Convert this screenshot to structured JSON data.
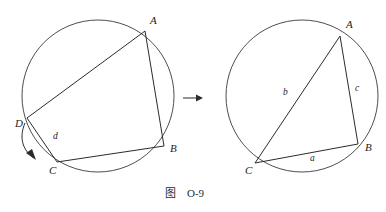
{
  "caption": {
    "prefix": "图",
    "number": "O-9"
  },
  "colors": {
    "ink": "#2b2b2b",
    "circle_stroke": "#3a3a3a",
    "background": "#ffffff"
  },
  "left_figure": {
    "name": "cyclic-quadrilateral-abcd",
    "circle": {
      "cx": 98,
      "cy": 96,
      "r": 76
    },
    "vertices": [
      {
        "id": "A",
        "label": "A",
        "x": 145,
        "y": 31,
        "label_x": 150,
        "label_y": 24
      },
      {
        "id": "B",
        "label": "B",
        "x": 164,
        "y": 146,
        "label_x": 170,
        "label_y": 152
      },
      {
        "id": "C",
        "label": "C",
        "x": 57,
        "y": 162,
        "label_x": 49,
        "label_y": 174
      },
      {
        "id": "D",
        "label": "D",
        "x": 27,
        "y": 118,
        "label_x": 15,
        "label_y": 127
      }
    ],
    "edges": [
      {
        "from": "D",
        "to": "A"
      },
      {
        "from": "A",
        "to": "B"
      },
      {
        "from": "B",
        "to": "C"
      },
      {
        "from": "C",
        "to": "D"
      }
    ],
    "side_labels": [
      {
        "text": "d",
        "x": 53,
        "y": 139
      }
    ],
    "motion_arrow": {
      "name": "d-to-c-motion-arrow",
      "from": "D",
      "to": "C",
      "path": "M 25 123 C 19 137 22 150 34 158",
      "head": "36,160 26,153 32,149"
    }
  },
  "right_figure": {
    "name": "inscribed-triangle-abc",
    "circle": {
      "cx": 302,
      "cy": 96,
      "r": 76
    },
    "vertices": [
      {
        "id": "A",
        "label": "A",
        "x": 340,
        "y": 36,
        "label_x": 346,
        "label_y": 28
      },
      {
        "id": "B",
        "label": "B",
        "x": 358,
        "y": 144,
        "label_x": 365,
        "label_y": 151
      },
      {
        "id": "C",
        "label": "C",
        "x": 255,
        "y": 163,
        "label_x": 245,
        "label_y": 174
      }
    ],
    "edges": [
      {
        "from": "C",
        "to": "A"
      },
      {
        "from": "A",
        "to": "B"
      },
      {
        "from": "C",
        "to": "B"
      }
    ],
    "side_labels": [
      {
        "text": "a",
        "x": 310,
        "y": 161
      },
      {
        "text": "b",
        "x": 283,
        "y": 95
      },
      {
        "text": "c",
        "x": 355,
        "y": 91
      }
    ]
  },
  "transform_arrow": {
    "name": "transform-arrow",
    "x1": 183,
    "y1": 98,
    "x2": 203,
    "y2": 98
  }
}
